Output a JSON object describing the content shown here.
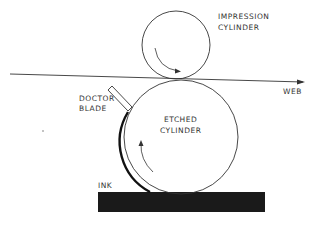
{
  "diagram": {
    "type": "gravure printing process schematic",
    "labels": {
      "impression_line1": "IMPRESSION",
      "impression_line2": "CYLINDER",
      "web": "WEB",
      "doctor_line1": "DOCTOR",
      "doctor_line2": "BLADE",
      "etched_line1": "ETCHED",
      "etched_line2": "CYLINDER",
      "ink": "INK"
    },
    "components": [
      {
        "name": "impression-cylinder",
        "shape": "circle",
        "rotation": "clockwise"
      },
      {
        "name": "etched-cylinder",
        "shape": "circle",
        "rotation": "counter-clockwise"
      },
      {
        "name": "web",
        "shape": "arrow-line",
        "direction": "left-to-right"
      },
      {
        "name": "doctor-blade",
        "shape": "angled rectangle"
      },
      {
        "name": "ink-trough",
        "shape": "filled rectangle"
      }
    ],
    "colors": {
      "line": "#222222",
      "ink": "#1a1a1a",
      "background": "#ffffff"
    }
  }
}
